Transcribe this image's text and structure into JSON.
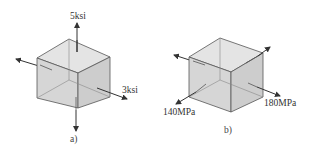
{
  "figures": [
    {
      "id": "a",
      "caption": "a)",
      "units": "ksi",
      "stresses": [
        {
          "axis": "vertical",
          "label": "5ksi",
          "value": 5
        },
        {
          "axis": "horizontal-right",
          "label": "3ksi",
          "value": 3
        }
      ]
    },
    {
      "id": "b",
      "caption": "b)",
      "units": "MPa",
      "stresses": [
        {
          "axis": "front-left",
          "label": "140MPa",
          "value": 140
        },
        {
          "axis": "right",
          "label": "180MPa",
          "value": 180
        }
      ]
    }
  ],
  "colors": {
    "cube_fill_front": "#d9d9d9",
    "cube_fill_top": "#e6e6e6",
    "cube_fill_side": "#cfcfcf",
    "edge": "#555555",
    "arrow": "#333333"
  }
}
